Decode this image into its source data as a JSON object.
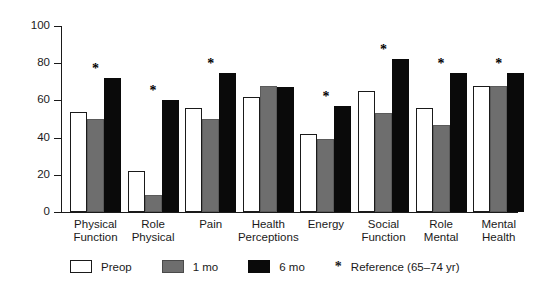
{
  "chart_data": {
    "type": "bar",
    "title": "",
    "xlabel": "",
    "ylabel": "",
    "ylim": [
      0,
      100
    ],
    "yticks": [
      0,
      20,
      40,
      60,
      80,
      100
    ],
    "grid": false,
    "legend_position": "bottom",
    "categories": [
      "Physical Function",
      "Role Physical",
      "Pain",
      "Health Perceptions",
      "Energy",
      "Social Function",
      "Role Mental",
      "Mental Health"
    ],
    "category_lines": [
      [
        "Physical",
        "Function"
      ],
      [
        "Role",
        "Physical"
      ],
      [
        "Pain",
        ""
      ],
      [
        "Health",
        "Perceptions"
      ],
      [
        "Energy",
        ""
      ],
      [
        "Social",
        "Function"
      ],
      [
        "Role",
        "Mental"
      ],
      [
        "Mental",
        "Health"
      ]
    ],
    "series": [
      {
        "name": "Preop",
        "color": "#ffffff",
        "values": [
          54,
          22,
          56,
          62,
          42,
          65,
          56,
          68
        ]
      },
      {
        "name": "1 mo",
        "color": "#6e6e6e",
        "values": [
          50,
          9,
          50,
          68,
          39,
          53,
          47,
          68
        ]
      },
      {
        "name": "6 mo",
        "color": "#0a0a0a",
        "values": [
          72,
          60,
          75,
          67,
          57,
          82,
          75,
          75
        ]
      }
    ],
    "annotations": {
      "symbol": "*",
      "meaning": "Reference (65–74 yr)",
      "marked_categories": [
        "Physical Function",
        "Role Physical",
        "Pain",
        "Energy",
        "Social Function",
        "Role Mental",
        "Mental Health"
      ],
      "reference_values": [
        72,
        60,
        75,
        null,
        57,
        82,
        75,
        75
      ]
    }
  },
  "legend": {
    "items": [
      {
        "label": "Preop",
        "swatch": "white-square-swatch"
      },
      {
        "label": "1 mo",
        "swatch": "gray-square-swatch"
      },
      {
        "label": "6 mo",
        "swatch": "black-square-swatch"
      }
    ],
    "reference": {
      "symbol": "*",
      "label": "Reference (65–74 yr)"
    }
  },
  "axis": {
    "y_tick_labels": [
      "100",
      "80",
      "60",
      "40",
      "20",
      "0"
    ]
  }
}
